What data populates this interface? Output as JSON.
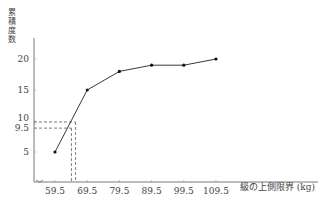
{
  "chart_data": {
    "type": "line",
    "title": "",
    "xlabel": "級の上側限界 (kg)",
    "ylabel": "累積度数",
    "ylabel_chars": [
      "累",
      "積",
      "度",
      "数"
    ],
    "x": [
      59.5,
      69.5,
      79.5,
      89.5,
      99.5,
      109.5
    ],
    "x_tick_labels": [
      "59.5",
      "69.5",
      "79.5",
      "89.5",
      "99.5",
      "109.5"
    ],
    "y_tick_labels": [
      "5",
      "9.5",
      "10",
      "15",
      "20"
    ],
    "y_ticks": [
      5,
      9.5,
      10,
      15,
      20
    ],
    "series": [
      {
        "name": "累積度数",
        "values": [
          5,
          15,
          18,
          19,
          19,
          20
        ]
      }
    ],
    "annotations": [
      {
        "type": "dashed-guide",
        "y": 10,
        "x_at": 66.5
      },
      {
        "type": "dashed-guide",
        "y": 9.5,
        "x_at": 65.5
      }
    ],
    "ylim": [
      0,
      22
    ],
    "grid": false,
    "legend": "none"
  }
}
